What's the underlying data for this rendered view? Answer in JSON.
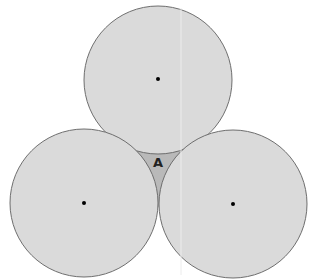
{
  "diagram": {
    "title": "",
    "colors": {
      "circle_fill": "#dadada",
      "circle_stroke": "#6e6e6e",
      "region_fill": "#b9b9b9",
      "dot": "#000000",
      "background": "#ffffff"
    },
    "circles": [
      {
        "name": "top",
        "cx": 158,
        "cy": 80,
        "r": 74
      },
      {
        "name": "left",
        "cx": 84,
        "cy": 203,
        "r": 74
      },
      {
        "name": "right",
        "cx": 233,
        "cy": 204,
        "r": 74
      }
    ],
    "region_label": "A"
  }
}
